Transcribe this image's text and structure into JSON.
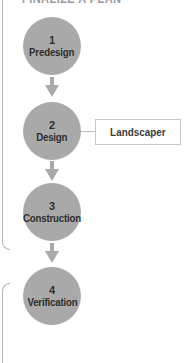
{
  "header": {
    "title": "FINALIZE A PLAN"
  },
  "steps": [
    {
      "number": "1",
      "label": "Predesign"
    },
    {
      "number": "2",
      "label": "Design"
    },
    {
      "number": "3",
      "label": "Construction"
    },
    {
      "number": "4",
      "label": "Verification"
    }
  ],
  "side_box": {
    "label": "Landscaper",
    "attached_to_step": "2"
  },
  "colors": {
    "circle_fill": "#a9a9a9",
    "text": "#2e2e2e",
    "border": "#b8b8b8"
  }
}
